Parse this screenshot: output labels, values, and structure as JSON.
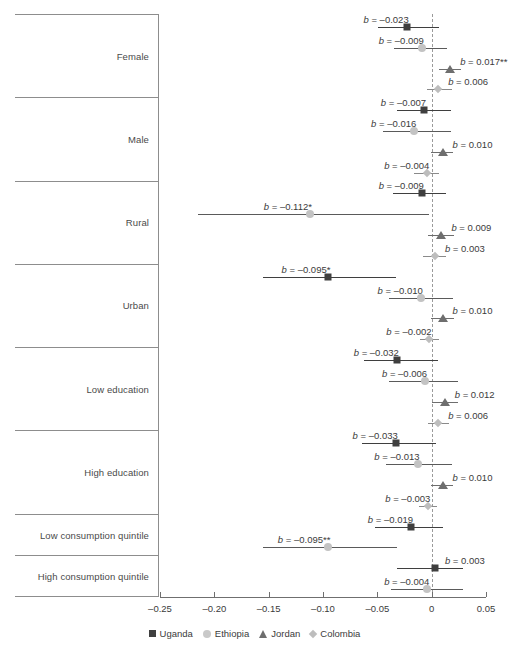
{
  "chart_data": {
    "type": "scatter",
    "title": "",
    "xlabel": "",
    "ylabel": "",
    "xlim": [
      -0.25,
      0.05
    ],
    "xticks": [
      -0.25,
      -0.2,
      -0.15,
      -0.1,
      -0.05,
      0,
      0.05
    ],
    "xticklabels": [
      "–0.25",
      "–0.20",
      "–0.15",
      "–0.10",
      "–0.05",
      "0",
      "0.05"
    ],
    "grid": false,
    "reference_line": 0,
    "legend_position": "bottom",
    "legend": [
      {
        "name": "Uganda",
        "marker": "square",
        "color": "#3f3f3f"
      },
      {
        "name": "Ethiopia",
        "marker": "circle",
        "color": "#c9c9c9"
      },
      {
        "name": "Jordan",
        "marker": "triangle",
        "color": "#6e6e6e"
      },
      {
        "name": "Colombia",
        "marker": "diamond",
        "color": "#bdbdbd"
      }
    ],
    "groups": [
      {
        "label": "Female",
        "points": [
          {
            "series": "Uganda",
            "estimate": -0.023,
            "ci_low": -0.049,
            "ci_high": 0.007,
            "label": "b = –0.023",
            "label_side": "left"
          },
          {
            "series": "Ethiopia",
            "estimate": -0.009,
            "ci_low": -0.035,
            "ci_high": 0.014,
            "label": "b = –0.009",
            "label_side": "left"
          },
          {
            "series": "Jordan",
            "estimate": 0.017,
            "ci_low": 0.007,
            "ci_high": 0.027,
            "label": "b = 0.017**",
            "label_side": "right"
          },
          {
            "series": "Colombia",
            "estimate": 0.006,
            "ci_low": -0.004,
            "ci_high": 0.019,
            "label": "b = 0.006",
            "label_side": "right"
          }
        ]
      },
      {
        "label": "Male",
        "points": [
          {
            "series": "Uganda",
            "estimate": -0.007,
            "ci_low": -0.032,
            "ci_high": 0.018,
            "label": "b = –0.007",
            "label_side": "left"
          },
          {
            "series": "Ethiopia",
            "estimate": -0.016,
            "ci_low": -0.045,
            "ci_high": 0.018,
            "label": "b = –0.016",
            "label_side": "left"
          },
          {
            "series": "Jordan",
            "estimate": 0.01,
            "ci_low": -0.001,
            "ci_high": 0.02,
            "label": "b = 0.010",
            "label_side": "right"
          },
          {
            "series": "Colombia",
            "estimate": -0.004,
            "ci_low": -0.016,
            "ci_high": 0.007,
            "label": "b = –0.004",
            "label_side": "left"
          }
        ]
      },
      {
        "label": "Rural",
        "points": [
          {
            "series": "Uganda",
            "estimate": -0.009,
            "ci_low": -0.036,
            "ci_high": 0.013,
            "label": "b = –0.009",
            "label_side": "left"
          },
          {
            "series": "Ethiopia",
            "estimate": -0.112,
            "ci_low": -0.215,
            "ci_high": -0.002,
            "label": "b = –0.112*",
            "label_side": "left"
          },
          {
            "series": "Jordan",
            "estimate": 0.009,
            "ci_low": -0.003,
            "ci_high": 0.021,
            "label": "b = 0.009",
            "label_side": "right"
          },
          {
            "series": "Colombia",
            "estimate": 0.003,
            "ci_low": -0.008,
            "ci_high": 0.013,
            "label": "b = 0.003",
            "label_side": "right"
          }
        ]
      },
      {
        "label": "Urban",
        "points": [
          {
            "series": "Uganda",
            "estimate": -0.095,
            "ci_low": -0.155,
            "ci_high": -0.033,
            "label": "b = –0.095*",
            "label_side": "left"
          },
          {
            "series": "Ethiopia",
            "estimate": -0.01,
            "ci_low": -0.039,
            "ci_high": 0.02,
            "label": "b = –0.010",
            "label_side": "left"
          },
          {
            "series": "Jordan",
            "estimate": 0.01,
            "ci_low": -0.001,
            "ci_high": 0.021,
            "label": "b = 0.010",
            "label_side": "right"
          },
          {
            "series": "Colombia",
            "estimate": -0.002,
            "ci_low": -0.011,
            "ci_high": 0.007,
            "label": "b = –0.002",
            "label_side": "left"
          }
        ]
      },
      {
        "label": "Low education",
        "points": [
          {
            "series": "Uganda",
            "estimate": -0.032,
            "ci_low": -0.062,
            "ci_high": 0.006,
            "label": "b = –0.032",
            "label_side": "left"
          },
          {
            "series": "Ethiopia",
            "estimate": -0.006,
            "ci_low": -0.039,
            "ci_high": 0.024,
            "label": "b = –0.006",
            "label_side": "left"
          },
          {
            "series": "Jordan",
            "estimate": 0.012,
            "ci_low": 0.0,
            "ci_high": 0.024,
            "label": "b = 0.012",
            "label_side": "right"
          },
          {
            "series": "Colombia",
            "estimate": 0.006,
            "ci_low": -0.003,
            "ci_high": 0.016,
            "label": "b = 0.006",
            "label_side": "right"
          }
        ]
      },
      {
        "label": "High education",
        "points": [
          {
            "series": "Uganda",
            "estimate": -0.033,
            "ci_low": -0.064,
            "ci_high": 0.004,
            "label": "b = –0.033",
            "label_side": "left"
          },
          {
            "series": "Ethiopia",
            "estimate": -0.013,
            "ci_low": -0.042,
            "ci_high": 0.019,
            "label": "b = –0.013",
            "label_side": "left"
          },
          {
            "series": "Jordan",
            "estimate": 0.01,
            "ci_low": -0.001,
            "ci_high": 0.02,
            "label": "b = 0.010",
            "label_side": "right"
          },
          {
            "series": "Colombia",
            "estimate": -0.003,
            "ci_low": -0.012,
            "ci_high": 0.005,
            "label": "b = –0.003",
            "label_side": "left"
          }
        ]
      },
      {
        "label": "Low consumption quintile",
        "points": [
          {
            "series": "Uganda",
            "estimate": -0.019,
            "ci_low": -0.052,
            "ci_high": 0.01,
            "label": "b = –0.019",
            "label_side": "left"
          },
          {
            "series": "Ethiopia",
            "estimate": -0.095,
            "ci_low": -0.155,
            "ci_high": -0.032,
            "label": "b = –0.095**",
            "label_side": "left"
          }
        ]
      },
      {
        "label": "High consumption quintile",
        "points": [
          {
            "series": "Uganda",
            "estimate": 0.003,
            "ci_low": -0.032,
            "ci_high": 0.029,
            "label": "b = 0.003",
            "label_side": "right"
          },
          {
            "series": "Ethiopia",
            "estimate": -0.004,
            "ci_low": -0.037,
            "ci_high": 0.029,
            "label": "b = –0.004",
            "label_side": "left"
          }
        ]
      }
    ]
  }
}
